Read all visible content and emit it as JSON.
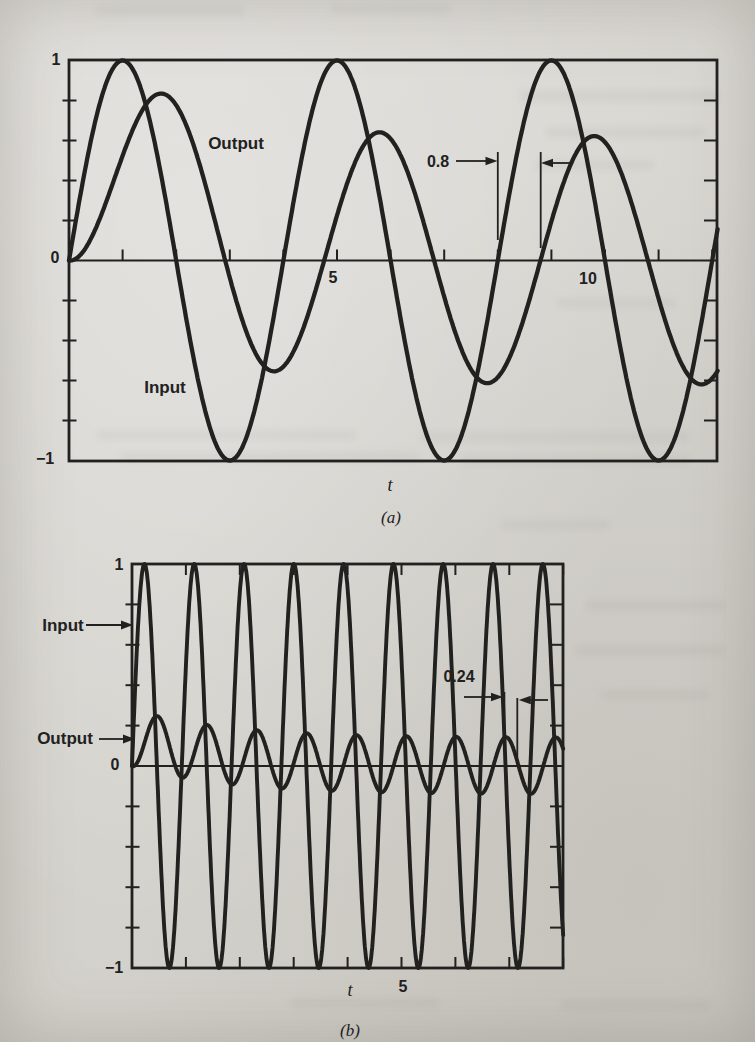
{
  "page": {
    "ink_color": "#21211f",
    "paper_color": "#d7d5d0"
  },
  "chart_data": [
    {
      "panel": "a",
      "type": "line",
      "title": "",
      "xlabel": "t",
      "caption": "(a)",
      "x_range": [
        0,
        12.1
      ],
      "y_range": [
        -1,
        1
      ],
      "x_tick_step": 1,
      "y_tick_step": 0.2,
      "grid": false,
      "x_tick_labels": [
        {
          "value": 5,
          "label": "5"
        },
        {
          "value": 10,
          "label": "10"
        }
      ],
      "y_axis_number_labels": [
        {
          "value": 1,
          "label": "1"
        },
        {
          "value": 0,
          "label": "0"
        },
        {
          "value": -1,
          "label": "−1"
        }
      ],
      "model": "y = a·sin(w·(t−d)) + c·exp(−t/tau)",
      "series": [
        {
          "label": "Input",
          "a": 1,
          "w": 1.5708,
          "d": 0,
          "c": 0,
          "tau": 1,
          "description": "unit-amplitude sine, period 4, peaks at t = 1, 5, 9"
        },
        {
          "label": "Output",
          "a": 0.62,
          "w": 1.5708,
          "d": 0.8,
          "c": 0.59,
          "tau": 1.74,
          "description": "delayed attenuated sine, steady amplitude ≈0.62, first peak ≈0.83 at t≈1.8"
        }
      ],
      "delay_annotation": {
        "label": "0.8",
        "t_input_zero": 8.0,
        "t_output_zero": 8.8
      }
    },
    {
      "panel": "b",
      "type": "line",
      "title": "",
      "xlabel": "t",
      "caption": "(b)",
      "x_range": [
        0,
        8
      ],
      "y_range": [
        -1,
        1
      ],
      "x_tick_step": 1,
      "y_tick_step": 0.2,
      "grid": false,
      "x_tick_labels": [
        {
          "value": 5,
          "label": "5"
        }
      ],
      "y_axis_number_labels": [
        {
          "value": 1,
          "label": "1"
        },
        {
          "value": 0,
          "label": "0"
        },
        {
          "value": -1,
          "label": "−1"
        }
      ],
      "model": "y = a·sin(w·(t−d)) + c·exp(−t/tau)",
      "series": [
        {
          "label": "Input",
          "a": 1,
          "w": 6.8,
          "d": 0,
          "c": 0,
          "tau": 1,
          "description": "unit-amplitude high-frequency sine, period ≈0.92"
        },
        {
          "label": "Output",
          "a": 0.14,
          "w": 6.8,
          "d": 0.24,
          "c": 0.14,
          "tau": 1.75,
          "description": "delayed attenuated sine, steady amplitude ≈0.14, first peak ≈0.26"
        }
      ],
      "delay_annotation": {
        "label": "0.24",
        "t_input_zero": 6.91,
        "t_output_zero": 7.15
      }
    }
  ]
}
